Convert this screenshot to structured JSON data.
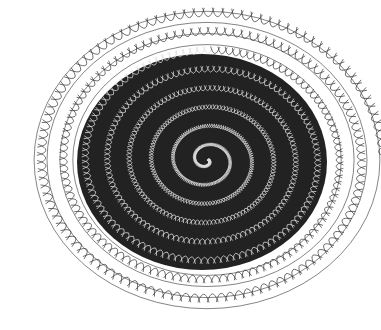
{
  "image": {
    "subject": "spiral line-art illustration of tooth-like shapes",
    "background": "#ffffff",
    "ink": "#000000",
    "center": [
      207,
      160
    ],
    "rx": 172,
    "ry": 148,
    "dark_core_rx": 125,
    "dark_core_ry": 108
  }
}
